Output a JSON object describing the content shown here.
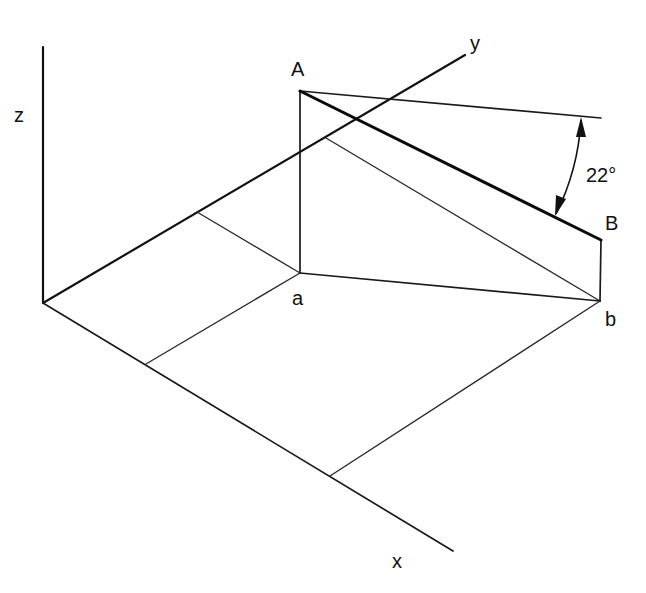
{
  "diagram": {
    "type": "3D isometric projection of line AB showing inclination angle",
    "colors": {
      "line": "#111111",
      "background": "#ffffff"
    },
    "axes": {
      "x": {
        "label": "x"
      },
      "y": {
        "label": "y"
      },
      "z": {
        "label": "z"
      }
    },
    "points": {
      "A": {
        "label": "A"
      },
      "B": {
        "label": "B"
      },
      "a": {
        "label": "a"
      },
      "b": {
        "label": "b"
      }
    },
    "angle": {
      "label": "22°",
      "value_degrees": 22,
      "between": [
        "line AB",
        "horizontal reference line through A"
      ]
    }
  }
}
